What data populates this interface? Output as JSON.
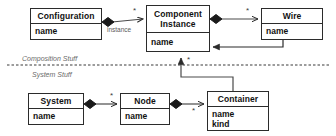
{
  "diagram": {
    "type": "uml-class-diagram",
    "width": 336,
    "height": 136,
    "background_color": "#ffffff",
    "line_color": "#2b2b2b",
    "text_color": "#111111"
  },
  "classes": [
    {
      "id": "configuration",
      "name": "Configuration",
      "attributes": [
        "name"
      ],
      "x": 30,
      "y": 8,
      "width": 72,
      "height": 32,
      "name_height": 15
    },
    {
      "id": "component-instance",
      "name": "Component\nInstance",
      "name_line1": "Component",
      "name_line2": "Instance",
      "attributes": [
        "name"
      ],
      "x": 146,
      "y": 5,
      "width": 64,
      "height": 47,
      "name_height": 27
    },
    {
      "id": "wire",
      "name": "Wire",
      "attributes": [
        "name"
      ],
      "x": 261,
      "y": 8,
      "width": 62,
      "height": 32,
      "name_height": 15
    },
    {
      "id": "system",
      "name": "System",
      "attributes": [
        "name"
      ],
      "x": 28,
      "y": 93,
      "width": 56,
      "height": 32,
      "name_height": 15
    },
    {
      "id": "node",
      "name": "Node",
      "attributes": [
        "name"
      ],
      "x": 120,
      "y": 93,
      "width": 50,
      "height": 32,
      "name_height": 15
    },
    {
      "id": "container",
      "name": "Container",
      "attributes": [
        "name",
        "kind"
      ],
      "x": 207,
      "y": 91,
      "width": 62,
      "height": 40,
      "name_height": 15
    }
  ],
  "region_labels": [
    {
      "id": "composition-stuff",
      "text": "Composition Stuff",
      "x": 22,
      "y": 55
    },
    {
      "id": "system-stuff",
      "text": "System Stuff",
      "x": 32,
      "y": 72
    }
  ],
  "separator": {
    "id": "dashed-separator",
    "style": "dashed",
    "x1": 7,
    "y1": 65,
    "x2": 330,
    "y2": 65,
    "color": "#3a3a3a"
  },
  "relationships": [
    {
      "id": "configuration-to-component-instance",
      "from": "configuration",
      "to": "component-instance",
      "kind": "composition",
      "label": "instance",
      "multiplicity": "*"
    },
    {
      "id": "component-instance-to-wire",
      "from": "component-instance",
      "to": "wire",
      "kind": "composition",
      "label": "",
      "multiplicity": "*"
    },
    {
      "id": "wire-to-component-instance",
      "from": "wire",
      "to": "component-instance",
      "kind": "association",
      "label": "",
      "multiplicity": ""
    },
    {
      "id": "container-to-component-instance",
      "from": "container",
      "to": "component-instance",
      "kind": "association",
      "label": "",
      "multiplicity": "*"
    },
    {
      "id": "system-to-node",
      "from": "system",
      "to": "node",
      "kind": "composition",
      "label": "",
      "multiplicity": "*"
    },
    {
      "id": "node-to-container",
      "from": "node",
      "to": "container",
      "kind": "composition",
      "label": "",
      "multiplicity": "*"
    }
  ],
  "multiplicity_markers": [
    {
      "id": "mult-config-ci",
      "text": "*",
      "x": 133,
      "y": 7
    },
    {
      "id": "mult-ci-wire",
      "text": "*",
      "x": 246,
      "y": 7
    },
    {
      "id": "mult-container-ci",
      "text": "*",
      "x": 187,
      "y": 56
    },
    {
      "id": "mult-system-node",
      "text": "*",
      "x": 110,
      "y": 92
    },
    {
      "id": "mult-node-container",
      "text": "*",
      "x": 192,
      "y": 107
    }
  ],
  "edge_labels": [
    {
      "id": "label-instance",
      "text": "instance",
      "x": 107,
      "y": 28
    }
  ]
}
